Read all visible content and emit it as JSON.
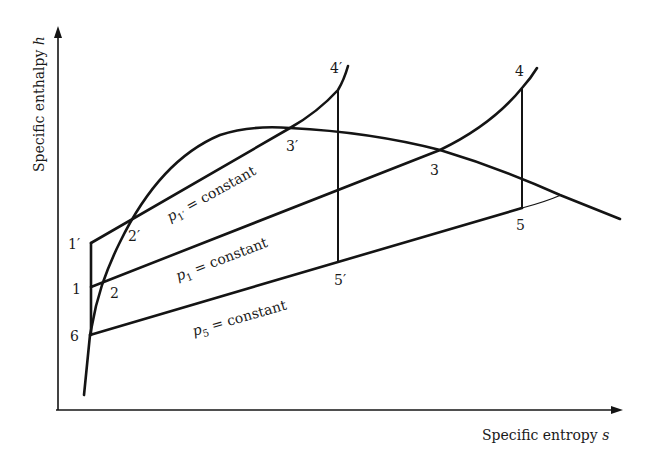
{
  "diagram": {
    "type": "h-s (Mollier) diagram of a reheat/regenerative vapour cycle",
    "axes": {
      "y_label": "Specific enthalpy h",
      "y_label_text": "Specific enthalpy ",
      "y_label_var": "h",
      "x_label": "Specific entropy s",
      "x_label_text": "Specific entropy ",
      "x_label_var": "s"
    },
    "isobars": [
      {
        "id": "p1prime",
        "symbol": "p",
        "subscript": "1′",
        "suffix": " = constant"
      },
      {
        "id": "p1",
        "symbol": "p",
        "subscript": "1",
        "suffix": " = constant"
      },
      {
        "id": "p5",
        "symbol": "p",
        "subscript": "5",
        "suffix": " = constant"
      }
    ],
    "points": {
      "p1p": "1′",
      "p2p": "2′",
      "p3p": "3′",
      "p4p": "4′",
      "p5p": "5′",
      "p1": "1",
      "p2": "2",
      "p3": "3",
      "p4": "4",
      "p5": "5",
      "p6": "6"
    },
    "colors": {
      "ink": "#141414",
      "background": "#ffffff"
    }
  }
}
